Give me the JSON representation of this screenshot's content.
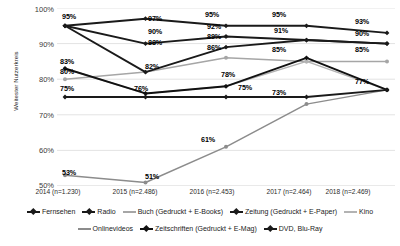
{
  "chart_data": {
    "type": "line",
    "title": "",
    "xlabel": "",
    "ylabel": "Weitester Nutzerkreis",
    "ylim": [
      50,
      100
    ],
    "ytick_labels": [
      "100%",
      "90%",
      "80%",
      "70%",
      "60%",
      "50%"
    ],
    "ytick_values": [
      100,
      90,
      80,
      70,
      60,
      50
    ],
    "grid": true,
    "legend_position": "bottom",
    "categories": [
      "2014 (n=1.230)",
      "2015 (n=2.486)",
      "2016 (n=2.453)",
      "2017 (n=2.464)",
      "2018 (n=2.469)"
    ],
    "series": [
      {
        "name": "Fernsehen",
        "color": "#1a1a1a",
        "marker": "diamond",
        "values": [
          95,
          97,
          95,
          95,
          93
        ],
        "labels": [
          "95%",
          "97%",
          "95%",
          "95%",
          "93%"
        ]
      },
      {
        "name": "Radio",
        "color": "#1a1a1a",
        "marker": "diamond",
        "values": [
          95,
          90,
          92,
          91,
          90
        ],
        "labels": [
          "95%",
          "90%",
          "92%",
          "91%",
          "90%"
        ]
      },
      {
        "name": "Buch (Gedruckt + E-Books)",
        "color": "#a6a6a6",
        "marker": "circle",
        "values": [
          80,
          82,
          86,
          85,
          85
        ],
        "labels": [
          "80%",
          "82%",
          "86%",
          "85%",
          "85%"
        ]
      },
      {
        "name": "Zeitung (Gedruckt + E-Paper)",
        "color": "#1a1a1a",
        "marker": "diamond",
        "values": [
          95,
          82,
          89,
          91,
          90
        ],
        "labels": [
          "95%",
          "82%",
          "89%",
          "91%",
          "90%"
        ]
      },
      {
        "name": "Kino",
        "color": "#b3b3b3",
        "marker": "circle",
        "values": [
          83,
          76,
          78,
          85,
          77
        ],
        "labels": [
          "83%",
          "76%",
          "78%",
          "85%",
          "77%"
        ]
      },
      {
        "name": "Onlinevideos",
        "color": "#8c8c8c",
        "marker": "circle",
        "values": [
          53,
          51,
          61,
          73,
          77
        ],
        "labels": [
          "53%",
          "51%",
          "61%",
          "73%",
          "77%"
        ]
      },
      {
        "name": "Zeitschriften (Gedruckt + E-Mag)",
        "color": "#111111",
        "marker": "diamond",
        "values": [
          83,
          76,
          78,
          86,
          77
        ],
        "labels": [
          "83%",
          "76%",
          "78%",
          "86%",
          "77%"
        ]
      },
      {
        "name": "DVD, Blu-Ray",
        "color": "#1a1a1a",
        "marker": "diamond",
        "values": [
          75,
          75,
          75,
          75,
          77
        ],
        "labels": [
          "75%",
          "75%",
          "75%",
          "75%",
          "77%"
        ]
      }
    ],
    "data_labels": [
      {
        "text": "95%",
        "x": 62,
        "y": 12
      },
      {
        "text": "97%",
        "x": 148,
        "y": 14
      },
      {
        "text": "90%",
        "x": 148,
        "y": 27
      },
      {
        "text": "88%",
        "x": 148,
        "y": 38
      },
      {
        "text": "82%",
        "x": 145,
        "y": 62
      },
      {
        "text": "95%",
        "x": 205,
        "y": 10
      },
      {
        "text": "92%",
        "x": 207,
        "y": 22
      },
      {
        "text": "89%",
        "x": 207,
        "y": 32
      },
      {
        "text": "86%",
        "x": 207,
        "y": 43
      },
      {
        "text": "95%",
        "x": 272,
        "y": 10
      },
      {
        "text": "91%",
        "x": 274,
        "y": 26
      },
      {
        "text": "85%",
        "x": 272,
        "y": 45
      },
      {
        "text": "93%",
        "x": 355,
        "y": 17
      },
      {
        "text": "90%",
        "x": 355,
        "y": 29
      },
      {
        "text": "85%",
        "x": 355,
        "y": 45
      },
      {
        "text": "83%",
        "x": 60,
        "y": 57
      },
      {
        "text": "80%",
        "x": 60,
        "y": 67
      },
      {
        "text": "75%",
        "x": 60,
        "y": 84
      },
      {
        "text": "76%",
        "x": 134,
        "y": 84
      },
      {
        "text": "78%",
        "x": 221,
        "y": 70
      },
      {
        "text": "75%",
        "x": 238,
        "y": 83
      },
      {
        "text": "73%",
        "x": 272,
        "y": 88
      },
      {
        "text": "77%",
        "x": 355,
        "y": 77
      },
      {
        "text": "61%",
        "x": 201,
        "y": 135
      },
      {
        "text": "53%",
        "x": 62,
        "y": 168
      },
      {
        "text": "51%",
        "x": 145,
        "y": 172
      }
    ]
  }
}
